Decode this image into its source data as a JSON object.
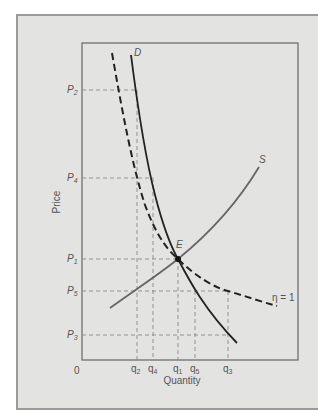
{
  "diagram": {
    "y_axis_label": "Price",
    "x_axis_label": "Quantity",
    "origin_label": "0",
    "price_labels": [
      {
        "id": "P2",
        "text": "P",
        "sub": "2",
        "y": 90
      },
      {
        "id": "P4",
        "text": "P",
        "sub": "4",
        "y": 178
      },
      {
        "id": "P1",
        "text": "P",
        "sub": "1",
        "y": 259
      },
      {
        "id": "P5",
        "text": "P",
        "sub": "5",
        "y": 291
      },
      {
        "id": "P3",
        "text": "P",
        "sub": "3",
        "y": 335
      }
    ],
    "quantity_labels": [
      {
        "id": "q2",
        "text": "q",
        "sub": "2",
        "x": 137
      },
      {
        "id": "q4",
        "text": "q",
        "sub": "4",
        "x": 153
      },
      {
        "id": "q1",
        "text": "q",
        "sub": "1",
        "x": 178
      },
      {
        "id": "q5",
        "text": "q",
        "sub": "5",
        "x": 195
      },
      {
        "id": "q3",
        "text": "q",
        "sub": "3",
        "x": 228
      }
    ],
    "curves": {
      "demand_label": "D",
      "supply_label": "S",
      "unit_elastic_label": "η = 1",
      "equilibrium_label": "E"
    },
    "colors": {
      "panel_bg": "#e3e3e1",
      "axis": "#555555",
      "demand": "#222222",
      "supply": "#666666",
      "dashed_curve": "#222222",
      "guide": "#888888"
    }
  }
}
